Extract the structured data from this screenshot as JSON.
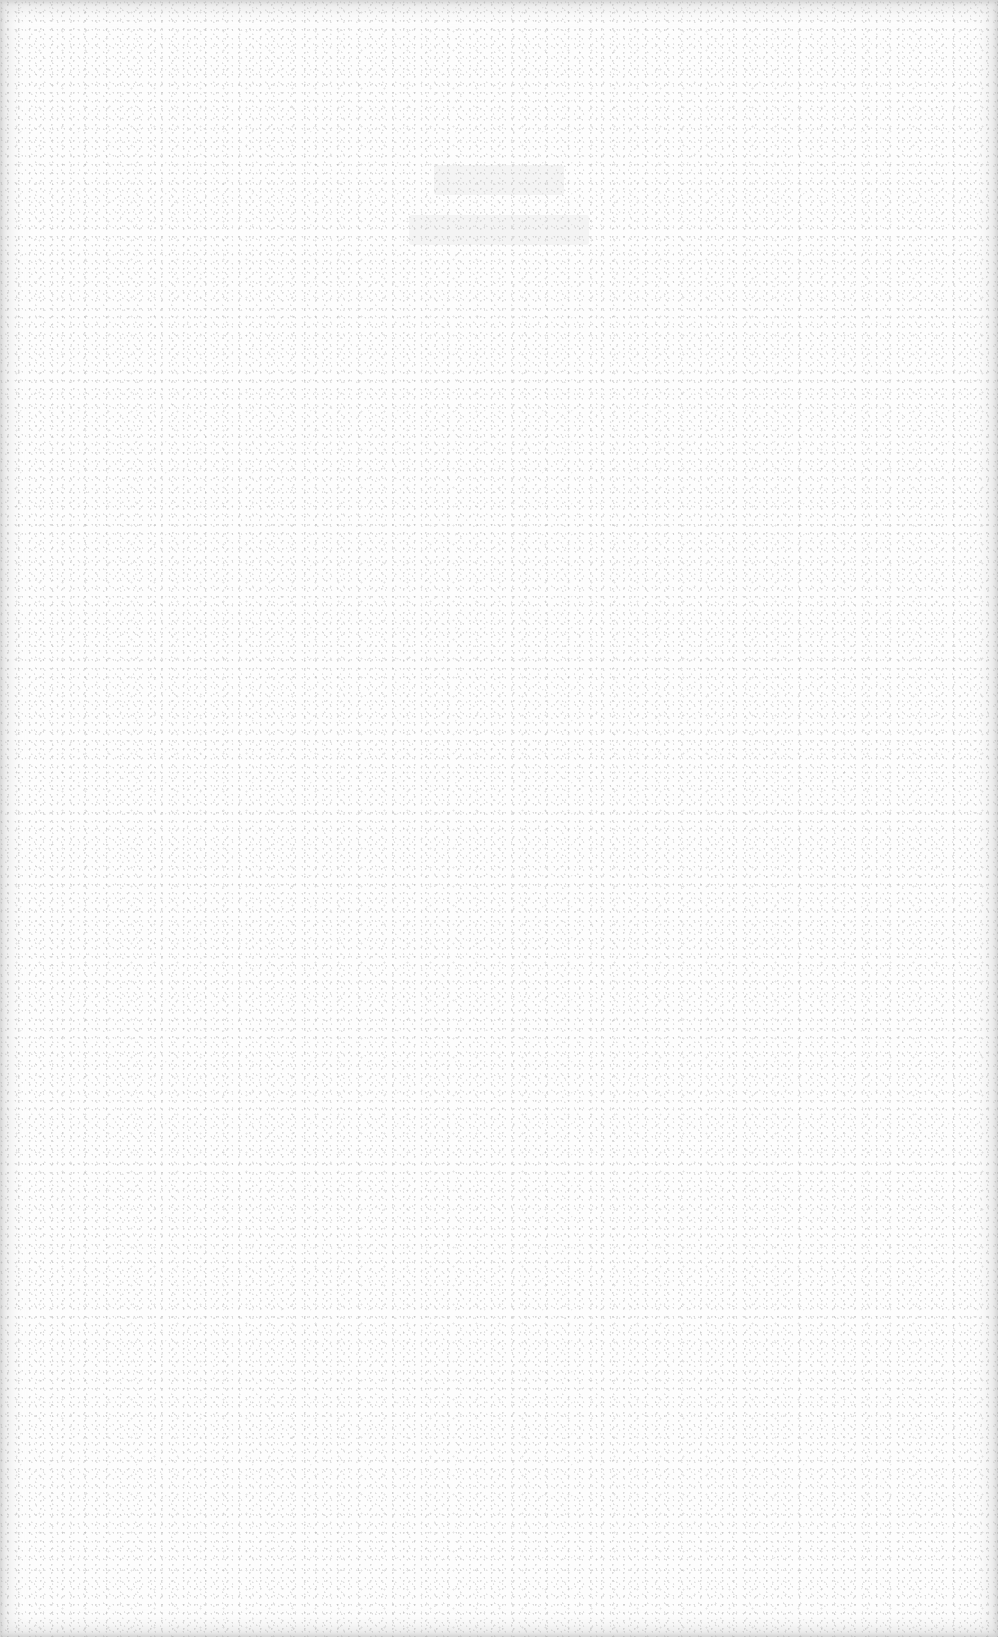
{
  "document": {
    "type": "scanned-page",
    "background_color": "#fdfdfd",
    "edge_shadow_color": "#c8c8c8",
    "speckle_color": "#aaaaaa",
    "heading_lines": [
      {
        "text": null,
        "legible": false
      },
      {
        "text": null,
        "legible": false
      }
    ],
    "body_text": null
  }
}
